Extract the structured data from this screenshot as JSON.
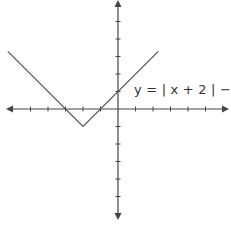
{
  "chart_data": {
    "type": "line",
    "title": "",
    "equation_label": "y = | x + 2 | − 1",
    "xlabel": "",
    "ylabel": "",
    "xlim": [
      -6.3,
      6.3
    ],
    "ylim": [
      -6.2,
      6.2
    ],
    "x_ticks": [
      -5,
      -4,
      -3,
      -2,
      -1,
      1,
      2,
      3,
      4,
      5
    ],
    "y_ticks": [
      -6,
      -5,
      -4,
      -3,
      -2,
      -1,
      1,
      2,
      3,
      4,
      5
    ],
    "grid": false,
    "axes_arrows": true,
    "series": [
      {
        "name": "y = |x + 2| - 1",
        "points": [
          [
            -6.3,
            3.3
          ],
          [
            -2,
            -1
          ],
          [
            2.3,
            3.3
          ]
        ]
      }
    ],
    "key_points": {
      "vertex": [
        -2,
        -1
      ],
      "x_intercepts": [
        [
          -3,
          0
        ],
        [
          -1,
          0
        ]
      ],
      "y_intercept": [
        0,
        1
      ]
    }
  },
  "style": {
    "axis_color": "#444444",
    "line_color": "#555555"
  }
}
